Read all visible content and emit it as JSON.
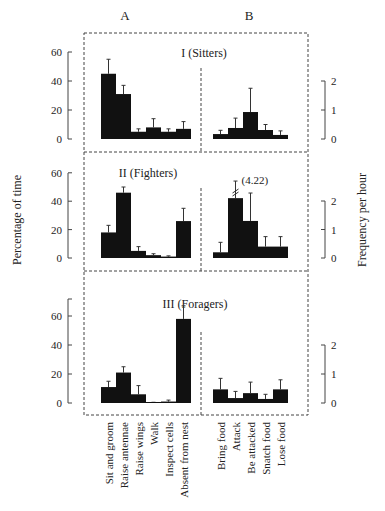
{
  "chart_data": {
    "type": "bar",
    "column_labels": [
      "A",
      "B"
    ],
    "left_axis": {
      "label": "Percentage of time",
      "ticks": [
        0,
        20,
        40,
        60
      ],
      "ylim": [
        0,
        60
      ]
    },
    "right_axis": {
      "label": "Frequency per hour",
      "ticks": [
        0,
        1,
        2
      ],
      "ylim": [
        0,
        2
      ]
    },
    "categories_A": [
      "Sit and groom",
      "Raise antennae",
      "Raise wings",
      "Walk",
      "Inspect cells",
      "Absent from nest"
    ],
    "categories_B": [
      "Bring food",
      "Attack",
      "Be attacked",
      "Snatch food",
      "Lose food"
    ],
    "panels": [
      {
        "title": "I (Sitters)",
        "A": {
          "values": [
            45,
            31,
            5,
            8,
            5,
            7
          ],
          "error_top": [
            55,
            37,
            7,
            14,
            7,
            12
          ]
        },
        "B": {
          "values": [
            0.17,
            0.38,
            0.93,
            0.31,
            0.14
          ],
          "error_top": [
            0.3,
            0.72,
            1.75,
            0.5,
            0.28
          ]
        }
      },
      {
        "title": "II (Fighters)",
        "A": {
          "values": [
            18,
            46,
            5,
            2,
            1,
            26
          ],
          "error_top": [
            23,
            50,
            8,
            3,
            1.5,
            35
          ]
        },
        "B": {
          "values": [
            0.2,
            2.1,
            1.3,
            0.4,
            0.4
          ],
          "error_top": [
            0.55,
            4.22,
            2.28,
            0.75,
            0.75
          ]
        },
        "annotation": "(4.22)"
      },
      {
        "title": "III (Foragers)",
        "A": {
          "values": [
            11,
            21,
            6,
            0.5,
            1,
            58
          ],
          "error_top": [
            15,
            25,
            12,
            0.5,
            2,
            67
          ]
        },
        "B": {
          "values": [
            0.47,
            0.17,
            0.34,
            0.14,
            0.47
          ],
          "error_top": [
            0.85,
            0.4,
            0.72,
            0.3,
            0.8
          ]
        }
      }
    ]
  }
}
